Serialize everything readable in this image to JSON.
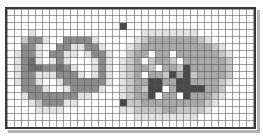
{
  "app": {
    "title": "Pixel Grid Viewer",
    "description": "Low-resolution grayscale raster displayed over a cell grid"
  },
  "grid": {
    "columns": 35,
    "rows": 17,
    "cell_size_px": 7,
    "grid_line_color": "#555555",
    "border_color": "#3a3a3a",
    "background_color": "#ffffff",
    "show_grid": true
  },
  "palette": {
    "white": "#ffffff",
    "light": "#e2e2e2",
    "mid_light": "#c6c6c6",
    "mid": "#a8a8a8",
    "mid_dark": "#8c8c8c",
    "dark": "#6e6e6e",
    "darker": "#4a4a4a",
    "black": "#2a2a2a"
  },
  "legend": {
    "levels": [
      {
        "name": "white",
        "value": 0
      },
      {
        "name": "light",
        "value": 1
      },
      {
        "name": "mid_light",
        "value": 2
      },
      {
        "name": "mid",
        "value": 3
      },
      {
        "name": "mid_dark",
        "value": 4
      },
      {
        "name": "dark",
        "value": 5
      },
      {
        "name": "darker",
        "value": 6
      },
      {
        "name": "black",
        "value": 7
      }
    ]
  },
  "regions": [
    {
      "name": "left-figure",
      "label": "handwritten-mark-cluster",
      "col_start": 2,
      "col_end": 14
    },
    {
      "name": "right-figure",
      "label": "cloud-blob-with-arrow",
      "col_start": 17,
      "col_end": 31
    },
    {
      "name": "top-speck",
      "label": "isolated-dark-speck",
      "col": 16,
      "row": 2
    }
  ],
  "pixels": [
    [
      0,
      0,
      0,
      0,
      0,
      0,
      0,
      0,
      0,
      0,
      0,
      0,
      0,
      0,
      0,
      0,
      0,
      0,
      0,
      0,
      0,
      0,
      0,
      0,
      0,
      0,
      0,
      0,
      0,
      0,
      0,
      0,
      0,
      0,
      0
    ],
    [
      0,
      0,
      0,
      0,
      0,
      0,
      0,
      0,
      0,
      0,
      0,
      0,
      0,
      0,
      0,
      0,
      0,
      0,
      0,
      0,
      0,
      0,
      0,
      0,
      0,
      0,
      0,
      0,
      0,
      0,
      0,
      0,
      0,
      0,
      0
    ],
    [
      0,
      0,
      0,
      0,
      0,
      0,
      0,
      0,
      0,
      0,
      0,
      0,
      0,
      0,
      0,
      0,
      6,
      0,
      0,
      0,
      0,
      0,
      0,
      0,
      0,
      0,
      0,
      0,
      0,
      0,
      0,
      0,
      0,
      0,
      0
    ],
    [
      0,
      0,
      0,
      1,
      0,
      0,
      0,
      0,
      0,
      0,
      0,
      0,
      0,
      0,
      0,
      0,
      0,
      0,
      0,
      1,
      1,
      1,
      1,
      1,
      1,
      1,
      1,
      0,
      0,
      0,
      0,
      0,
      0,
      0,
      0
    ],
    [
      0,
      0,
      2,
      4,
      4,
      1,
      0,
      0,
      4,
      4,
      4,
      4,
      1,
      0,
      0,
      0,
      0,
      0,
      1,
      2,
      3,
      3,
      3,
      3,
      3,
      3,
      3,
      2,
      1,
      0,
      0,
      0,
      0,
      0,
      0
    ],
    [
      0,
      0,
      4,
      4,
      1,
      0,
      0,
      4,
      4,
      1,
      1,
      4,
      4,
      1,
      0,
      0,
      0,
      1,
      2,
      3,
      3,
      3,
      3,
      3,
      3,
      3,
      3,
      3,
      3,
      2,
      1,
      0,
      0,
      0,
      0
    ],
    [
      0,
      1,
      4,
      4,
      1,
      0,
      4,
      4,
      1,
      1,
      0,
      1,
      4,
      4,
      1,
      0,
      0,
      2,
      3,
      3,
      0,
      3,
      3,
      0,
      3,
      3,
      3,
      3,
      3,
      3,
      2,
      1,
      0,
      0,
      0
    ],
    [
      0,
      1,
      4,
      5,
      1,
      0,
      1,
      4,
      1,
      0,
      0,
      0,
      1,
      4,
      1,
      0,
      1,
      2,
      3,
      0,
      2,
      3,
      3,
      2,
      0,
      3,
      3,
      3,
      3,
      3,
      3,
      2,
      0,
      0,
      0
    ],
    [
      0,
      1,
      4,
      5,
      5,
      4,
      4,
      5,
      4,
      1,
      0,
      0,
      1,
      4,
      1,
      0,
      1,
      2,
      3,
      3,
      2,
      0,
      3,
      3,
      2,
      6,
      3,
      3,
      3,
      3,
      3,
      2,
      0,
      0,
      0
    ],
    [
      0,
      1,
      4,
      4,
      1,
      1,
      1,
      4,
      4,
      4,
      1,
      0,
      1,
      4,
      1,
      0,
      1,
      2,
      3,
      0,
      3,
      3,
      2,
      6,
      3,
      6,
      2,
      3,
      3,
      3,
      3,
      2,
      0,
      0,
      0
    ],
    [
      0,
      1,
      4,
      4,
      1,
      0,
      0,
      1,
      4,
      4,
      4,
      4,
      4,
      4,
      1,
      0,
      1,
      2,
      3,
      3,
      6,
      6,
      3,
      3,
      6,
      6,
      3,
      3,
      3,
      3,
      2,
      1,
      0,
      0,
      0
    ],
    [
      0,
      0,
      4,
      4,
      4,
      1,
      0,
      0,
      1,
      4,
      4,
      4,
      4,
      1,
      0,
      0,
      1,
      2,
      3,
      2,
      6,
      6,
      0,
      3,
      6,
      6,
      6,
      6,
      3,
      3,
      2,
      0,
      0,
      0,
      0
    ],
    [
      0,
      0,
      1,
      4,
      4,
      4,
      4,
      4,
      4,
      4,
      1,
      1,
      0,
      0,
      0,
      0,
      1,
      2,
      3,
      3,
      6,
      0,
      3,
      3,
      0,
      6,
      3,
      3,
      3,
      2,
      1,
      0,
      0,
      0,
      0
    ],
    [
      0,
      0,
      0,
      1,
      2,
      4,
      4,
      4,
      1,
      1,
      0,
      0,
      0,
      0,
      0,
      0,
      6,
      2,
      2,
      3,
      3,
      3,
      3,
      3,
      3,
      3,
      3,
      3,
      2,
      1,
      0,
      0,
      0,
      0,
      0
    ],
    [
      0,
      0,
      0,
      0,
      1,
      1,
      1,
      1,
      0,
      0,
      0,
      0,
      0,
      0,
      0,
      0,
      1,
      1,
      2,
      2,
      2,
      2,
      3,
      3,
      2,
      2,
      2,
      2,
      1,
      0,
      0,
      0,
      0,
      0,
      0
    ],
    [
      0,
      0,
      0,
      0,
      0,
      0,
      0,
      0,
      0,
      0,
      0,
      0,
      0,
      0,
      0,
      0,
      0,
      0,
      1,
      1,
      1,
      1,
      1,
      1,
      1,
      1,
      1,
      0,
      0,
      0,
      0,
      0,
      0,
      0,
      0
    ],
    [
      0,
      0,
      0,
      0,
      0,
      0,
      0,
      0,
      0,
      0,
      0,
      0,
      0,
      0,
      0,
      0,
      0,
      0,
      0,
      0,
      0,
      0,
      0,
      0,
      0,
      0,
      0,
      0,
      0,
      0,
      0,
      0,
      0,
      0,
      0
    ]
  ]
}
